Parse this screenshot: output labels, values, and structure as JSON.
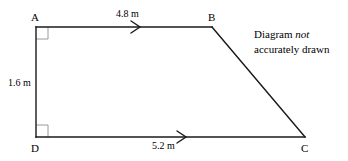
{
  "figure": {
    "type": "geometry-diagram",
    "shape": "trapezium",
    "background_color": "#ffffff",
    "stroke_color": "#1a1a1a",
    "marker_color": "#9a9a9a",
    "vertices": [
      {
        "id": "A",
        "label": "A",
        "x": 36,
        "y": 27
      },
      {
        "id": "B",
        "label": "B",
        "x": 212,
        "y": 27
      },
      {
        "id": "C",
        "label": "C",
        "x": 305,
        "y": 137
      },
      {
        "id": "D",
        "label": "D",
        "x": 36,
        "y": 137
      }
    ],
    "edges": [
      {
        "id": "AB",
        "from": "A",
        "to": "B",
        "measure": "4.8 m",
        "parallel_marks": 1
      },
      {
        "id": "BC",
        "from": "B",
        "to": "C",
        "measure": "",
        "parallel_marks": 0
      },
      {
        "id": "DC",
        "from": "D",
        "to": "C",
        "measure": "5.2 m",
        "parallel_marks": 1
      },
      {
        "id": "AD",
        "from": "A",
        "to": "D",
        "measure": "1.6 m",
        "parallel_marks": 0
      }
    ],
    "right_angles": [
      {
        "at": "A",
        "size": 12
      },
      {
        "at": "D",
        "size": 12
      }
    ],
    "measures": {
      "ab": "4.8 m",
      "dc": "5.2 m",
      "ad": "1.6 m"
    },
    "note": {
      "line1_prefix": "Diagram ",
      "line1_emphasis": "not",
      "line2": "accurately drawn"
    }
  }
}
